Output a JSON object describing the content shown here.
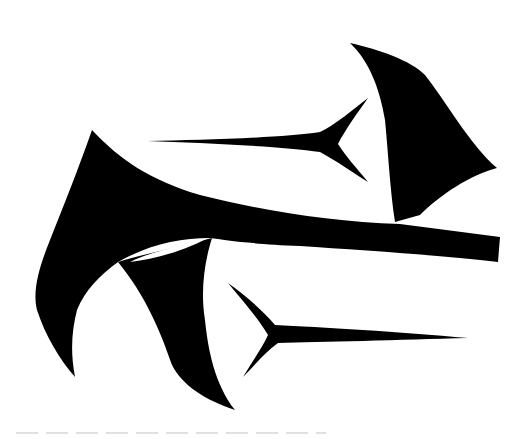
{
  "image": {
    "description": "Black calligraphic glyph on white background",
    "colors": {
      "ink": "#000000",
      "background": "#ffffff",
      "artifact": "#d8d8d8"
    },
    "strokes": [
      {
        "name": "left-hook-stroke"
      },
      {
        "name": "main-horizontal-stroke"
      },
      {
        "name": "top-right-wedge-stroke"
      },
      {
        "name": "upper-spur-stroke"
      },
      {
        "name": "lower-spur-stroke"
      },
      {
        "name": "lower-left-leg-stroke"
      }
    ]
  }
}
